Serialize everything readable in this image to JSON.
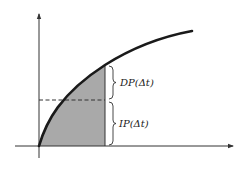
{
  "diagram": {
    "type": "area-under-concave-curve",
    "colors": {
      "axis": "#333333",
      "curve": "#1a1a1a",
      "shade": "#a9a9a9",
      "dashed": "#333333",
      "background": "#ffffff"
    },
    "labels": {
      "upper_brace": "DP(Δt)",
      "lower_brace": "IP(Δt)"
    }
  }
}
